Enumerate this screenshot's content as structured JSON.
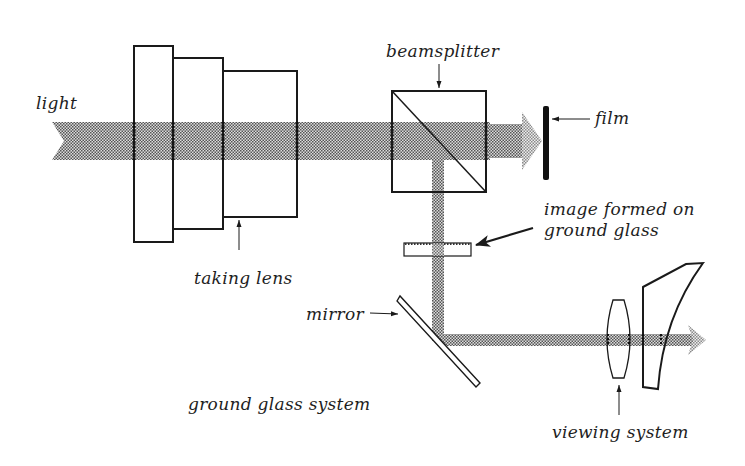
{
  "diagram": {
    "type": "optical-system",
    "colors": {
      "line": "#1a1a1a",
      "beam_dark": "#5a5a5a",
      "beam_light": "#dcdcdc",
      "film": "#111111",
      "background": "#ffffff"
    },
    "labels": {
      "light": "light",
      "beamsplitter": "beamsplitter",
      "film": "film",
      "image_formed_line1": "image formed on",
      "image_formed_line2": "ground glass",
      "taking_lens": "taking lens",
      "mirror": "mirror",
      "ground_glass_system": "ground glass system",
      "viewing_system": "viewing system"
    },
    "components": [
      {
        "id": "light-beam-in",
        "label": "light",
        "role": "incoming light beam"
      },
      {
        "id": "taking-lens",
        "label": "taking lens",
        "elements": 3
      },
      {
        "id": "beamsplitter",
        "label": "beamsplitter",
        "role": "splits beam to film and viewfinder"
      },
      {
        "id": "film",
        "label": "film",
        "role": "receives transmitted beam"
      },
      {
        "id": "ground-glass",
        "label": "image formed on ground glass"
      },
      {
        "id": "mirror",
        "label": "mirror",
        "role": "redirects beam horizontally"
      },
      {
        "id": "viewing-lens",
        "label": "viewing system",
        "elements": 2
      }
    ],
    "groups": [
      {
        "label": "ground glass system",
        "members": [
          "ground-glass",
          "mirror"
        ]
      },
      {
        "label": "viewing system",
        "members": [
          "viewing-lens"
        ]
      }
    ]
  }
}
